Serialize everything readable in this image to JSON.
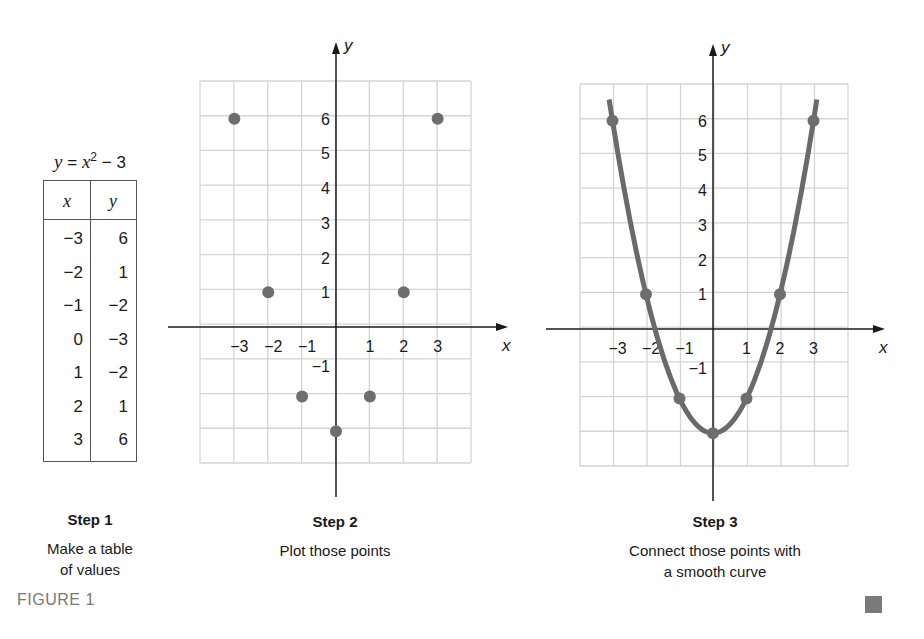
{
  "figure_label": "FIGURE 1",
  "equation": {
    "lhs": "y",
    "rhs_var": "x",
    "exp": "2",
    "rest": " − 3"
  },
  "table": {
    "headers": [
      "x",
      "y"
    ],
    "rows": [
      [
        "−3",
        "6"
      ],
      [
        "−2",
        "1"
      ],
      [
        "−1",
        "−2"
      ],
      [
        "0",
        "−3"
      ],
      [
        "1",
        "−2"
      ],
      [
        "2",
        "1"
      ],
      [
        "3",
        "6"
      ]
    ]
  },
  "steps": [
    {
      "title": "Step 1",
      "desc_line1": "Make a table",
      "desc_line2": "of values"
    },
    {
      "title": "Step 2",
      "desc_line1": "Plot those points",
      "desc_line2": ""
    },
    {
      "title": "Step 3",
      "desc_line1": "Connect those points with",
      "desc_line2": "a smooth curve"
    }
  ],
  "colors": {
    "point": "#6e6e6e",
    "curve": "#6a6a6a",
    "grid": "#d4d4d4",
    "axis": "#1a1a1a"
  },
  "chart_data": [
    {
      "type": "table",
      "title": "y = x² − 3",
      "columns": [
        "x",
        "y"
      ],
      "rows": [
        [
          -3,
          6
        ],
        [
          -2,
          1
        ],
        [
          -1,
          -2
        ],
        [
          0,
          -3
        ],
        [
          1,
          -2
        ],
        [
          2,
          1
        ],
        [
          3,
          6
        ]
      ]
    },
    {
      "type": "scatter",
      "title": "Step 2 — Plot those points",
      "xlabel": "x",
      "ylabel": "y",
      "x": [
        -3,
        -2,
        -1,
        0,
        1,
        2,
        3
      ],
      "y": [
        6,
        1,
        -2,
        -3,
        -2,
        1,
        6
      ],
      "x_ticks": [
        "−3",
        "−2",
        "−1",
        "1",
        "2",
        "3"
      ],
      "y_ticks": [
        "6",
        "5",
        "4",
        "3",
        "2",
        "1",
        "−1"
      ],
      "xlim": [
        -4,
        4
      ],
      "ylim": [
        -4,
        7
      ],
      "grid": true
    },
    {
      "type": "line",
      "title": "Step 3 — Connect those points with a smooth curve",
      "xlabel": "x",
      "ylabel": "y",
      "function": "y = x^2 - 3",
      "x": [
        -3,
        -2,
        -1,
        0,
        1,
        2,
        3
      ],
      "y": [
        6,
        1,
        -2,
        -3,
        -2,
        1,
        6
      ],
      "x_ticks": [
        "−3",
        "−2",
        "−1",
        "1",
        "2",
        "3"
      ],
      "y_ticks": [
        "6",
        "5",
        "4",
        "3",
        "2",
        "1",
        "−1"
      ],
      "xlim": [
        -4,
        4
      ],
      "ylim": [
        -4,
        7
      ],
      "grid": true,
      "markers": true
    }
  ]
}
